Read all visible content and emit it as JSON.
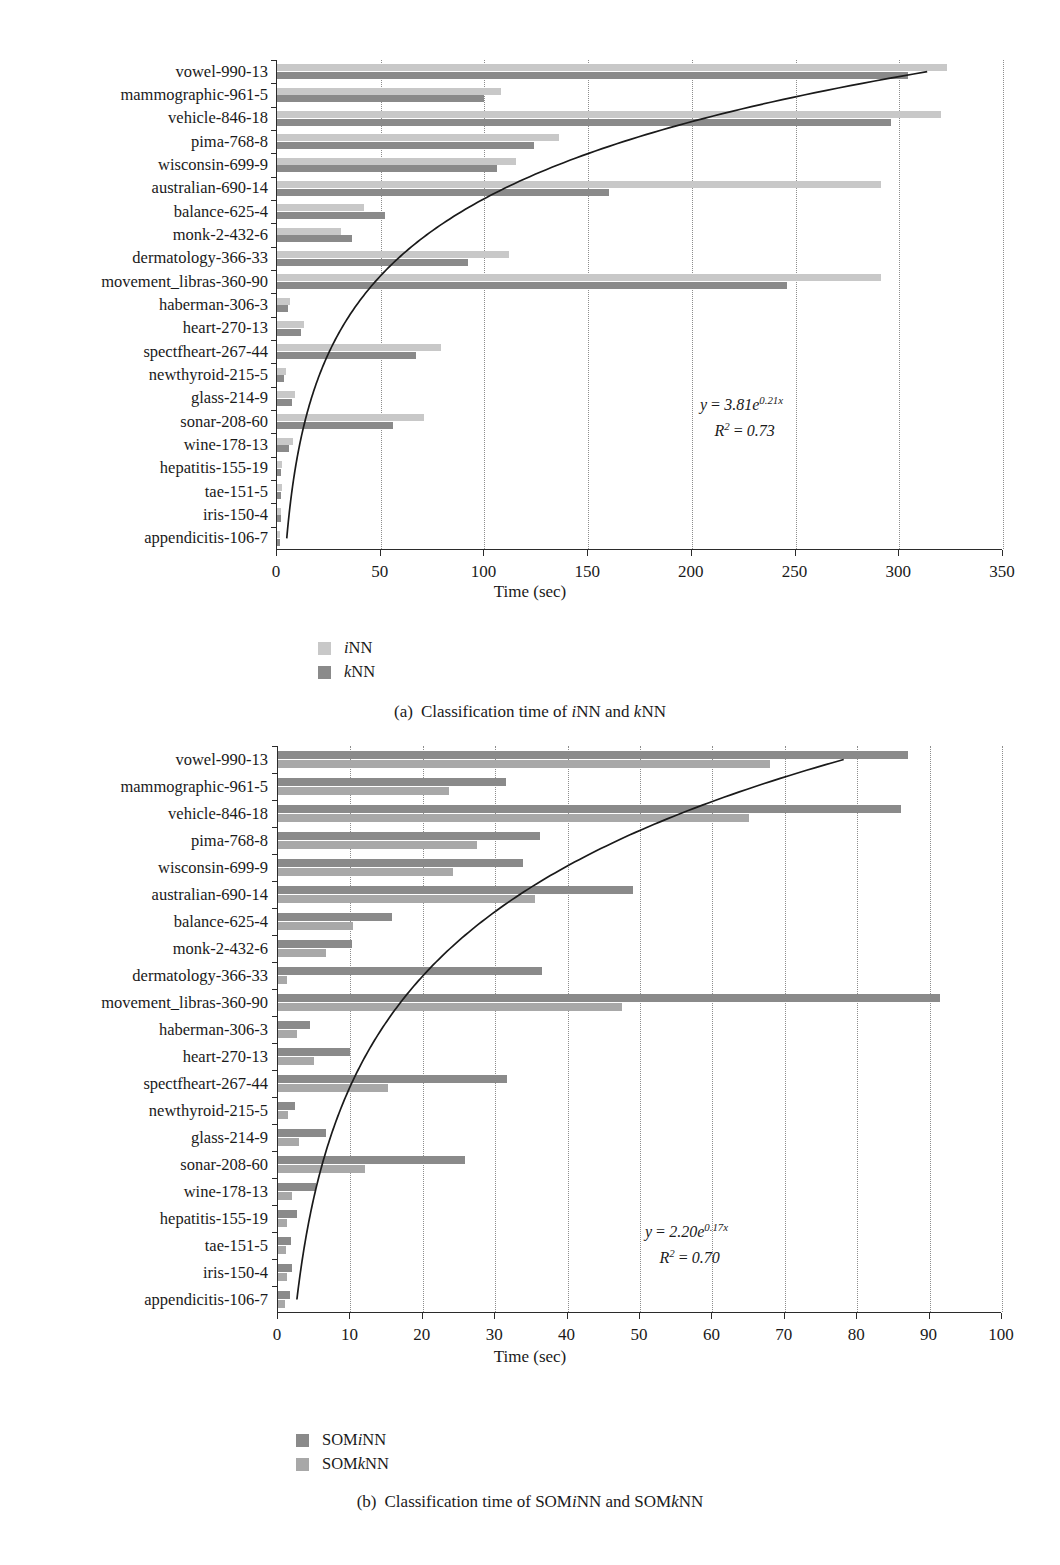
{
  "figure_a": {
    "caption_prefix": "(a)",
    "caption_text": "Classification time of iNN and kNN",
    "xlabel": "Time (sec)",
    "annotation_eq": "y = 3.81e0.21x",
    "annotation_r2": "R2 = 0.73",
    "legend": [
      {
        "label": "iNN",
        "color": "#c8c8c8"
      },
      {
        "label": "kNN",
        "color": "#8a8a8a"
      }
    ]
  },
  "figure_b": {
    "caption_prefix": "(b)",
    "caption_text": "Classification time of SOMiNN and SOMkNN",
    "xlabel": "Time (sec)",
    "annotation_eq": "y = 2.20e0.17x",
    "annotation_r2": "R2 = 0.70",
    "legend": [
      {
        "label": "SOMiNN",
        "color": "#8a8a8a"
      },
      {
        "label": "SOMkNN",
        "color": "#a8a8a8"
      }
    ]
  },
  "chart_data": [
    {
      "type": "bar",
      "orientation": "horizontal",
      "title": "(a) Classification time of iNN and kNN",
      "xlabel": "Time (sec)",
      "ylabel": "",
      "xlim": [
        0,
        350
      ],
      "xticks": [
        0,
        50,
        100,
        150,
        200,
        250,
        300,
        350
      ],
      "grid": "vertical-dotted",
      "legend_position": "below-left",
      "categories": [
        "vowel-990-13",
        "mammographic-961-5",
        "vehicle-846-18",
        "pima-768-8",
        "wisconsin-699-9",
        "australian-690-14",
        "balance-625-4",
        "monk-2-432-6",
        "dermatology-366-33",
        "movement_libras-360-90",
        "haberman-306-3",
        "heart-270-13",
        "spectfheart-267-44",
        "newthyroid-215-5",
        "glass-214-9",
        "sonar-208-60",
        "wine-178-13",
        "hepatitis-155-19",
        "tae-151-5",
        "iris-150-4",
        "appendicitis-106-7"
      ],
      "series": [
        {
          "name": "iNN",
          "color": "#c8c8c8",
          "values": [
            323,
            108,
            320,
            136,
            115,
            291,
            42,
            31,
            112,
            291,
            6.5,
            13,
            79,
            4.5,
            8.5,
            71,
            7.5,
            2.5,
            2.2,
            2.0,
            1.6
          ]
        },
        {
          "name": "kNN",
          "color": "#8a8a8a",
          "values": [
            304,
            100,
            296,
            124,
            106,
            160,
            52,
            36,
            92,
            246,
            5.5,
            11.5,
            67,
            3.6,
            7.0,
            56,
            6.0,
            2.0,
            1.8,
            1.7,
            1.3
          ]
        }
      ],
      "trendline": {
        "equation": "y = 3.81e^{0.21x}",
        "r_squared": 0.73,
        "coefficient": 3.81,
        "exponent": 0.21,
        "note": "exponential fit drawn across plot"
      }
    },
    {
      "type": "bar",
      "orientation": "horizontal",
      "title": "(b) Classification time of SOMiNN and SOMkNN",
      "xlabel": "Time (sec)",
      "ylabel": "",
      "xlim": [
        0,
        100
      ],
      "xticks": [
        0,
        10,
        20,
        30,
        40,
        50,
        60,
        70,
        80,
        90,
        100
      ],
      "grid": "vertical-dotted",
      "legend_position": "below-left",
      "categories": [
        "vowel-990-13",
        "mammographic-961-5",
        "vehicle-846-18",
        "pima-768-8",
        "wisconsin-699-9",
        "australian-690-14",
        "balance-625-4",
        "monk-2-432-6",
        "dermatology-366-33",
        "movement_libras-360-90",
        "haberman-306-3",
        "heart-270-13",
        "spectfheart-267-44",
        "newthyroid-215-5",
        "glass-214-9",
        "sonar-208-60",
        "wine-178-13",
        "hepatitis-155-19",
        "tae-151-5",
        "iris-150-4",
        "appendicitis-106-7"
      ],
      "series": [
        {
          "name": "SOMiNN",
          "color": "#8a8a8a",
          "values": [
            87.0,
            31.5,
            86.0,
            36.2,
            33.8,
            49.0,
            15.8,
            10.2,
            36.5,
            91.5,
            4.4,
            10.0,
            31.6,
            2.3,
            6.6,
            25.8,
            5.2,
            2.6,
            1.8,
            1.9,
            1.7
          ]
        },
        {
          "name": "SOMkNN",
          "color": "#a8a8a8",
          "values": [
            68.0,
            23.6,
            65.0,
            27.5,
            24.2,
            35.5,
            10.4,
            6.6,
            1.2,
            47.5,
            2.6,
            5.0,
            15.2,
            1.4,
            2.9,
            12.0,
            1.9,
            1.3,
            1.1,
            1.2,
            1.0
          ]
        }
      ],
      "trendline": {
        "equation": "y = 2.20e^{0.17x}",
        "r_squared": 0.7,
        "coefficient": 2.2,
        "exponent": 0.17,
        "note": "exponential fit drawn across plot"
      }
    }
  ]
}
